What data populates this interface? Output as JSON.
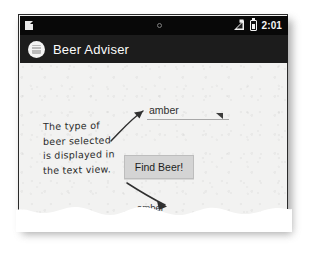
{
  "figure": {
    "kind": "annotated-android-screenshot",
    "paper_color": "#f2f2f1",
    "ink_color": "#2b2b2b"
  },
  "statusbar": {
    "notification_icon": "document-icon",
    "small_circle_icon": "dot-icon",
    "signal_icon": "signal-bars-icon",
    "battery_icon": "battery-icon",
    "time": "2:01",
    "background": "#080808"
  },
  "appbar": {
    "icon": "beer-mug-app-icon",
    "title": "Beer Adviser",
    "background": "#1c1c1c"
  },
  "app": {
    "spinner": {
      "name": "beer-type-spinner",
      "value": "amber",
      "caret_icon": "dropdown-caret-icon"
    },
    "button": {
      "name": "find-beer-button",
      "label": "Find Beer!",
      "background": "#d4d4d4"
    },
    "result_textview": {
      "name": "result-text-view",
      "value": "amber"
    }
  },
  "annotation": {
    "lines": [
      "The type of",
      "beer selected",
      "is displayed in",
      "the text view."
    ],
    "arrows": [
      {
        "name": "arrow-to-spinner",
        "points_to": "beer-type-spinner"
      },
      {
        "name": "arrow-to-result-text",
        "points_to": "result-text-view"
      }
    ]
  }
}
